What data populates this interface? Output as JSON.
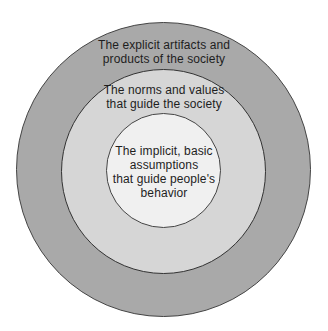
{
  "diagram": {
    "type": "concentric-circles",
    "colors": {
      "outer_fill": "#a9a9a9",
      "middle_fill": "#d6d6d6",
      "inner_fill": "#f0f0f0",
      "stroke": "#444444",
      "text": "#1e1e1e"
    },
    "layers": [
      {
        "name": "outer",
        "lines": [
          "The explicit artifacts and",
          "products of the society"
        ]
      },
      {
        "name": "middle",
        "lines": [
          "The norms and values",
          "that guide the society"
        ]
      },
      {
        "name": "inner",
        "lines": [
          "The implicit, basic",
          "assumptions",
          "that guide people's",
          "behavior"
        ]
      }
    ]
  }
}
